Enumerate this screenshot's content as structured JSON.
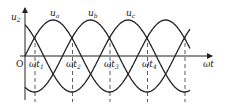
{
  "diagram": {
    "y_axis_label": "u",
    "y_axis_sub": "2",
    "x_axis_label": "ωt",
    "origin_label": "O",
    "curves": [
      {
        "label": "u",
        "sub": "a",
        "phase_px": 0
      },
      {
        "label": "u",
        "sub": "b",
        "phase_px": 37.5
      },
      {
        "label": "u",
        "sub": "c",
        "phase_px": 75
      }
    ],
    "ticks": [
      {
        "label": "ωt",
        "sub": "1"
      },
      {
        "label": "ωt",
        "sub": "2"
      },
      {
        "label": "ωt",
        "sub": "3"
      },
      {
        "label": "ωt",
        "sub": "4"
      }
    ],
    "colors": {
      "line": "#222222"
    }
  }
}
